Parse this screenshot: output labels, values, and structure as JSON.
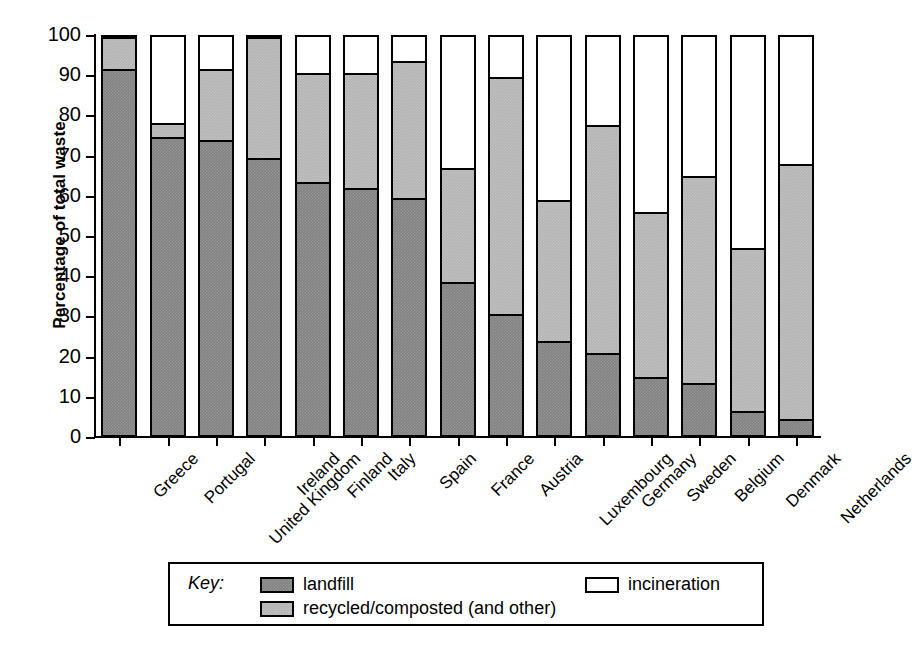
{
  "chart_data": {
    "type": "bar",
    "subtype": "stacked-bar-100",
    "title": "",
    "xlabel": "",
    "ylabel": "Percentage of total waste",
    "ylim": [
      0,
      100
    ],
    "yticks": [
      0,
      10,
      20,
      30,
      40,
      50,
      60,
      70,
      80,
      90,
      100
    ],
    "grid": false,
    "legend_position": "bottom",
    "legend_prefix": "Key:",
    "categories": [
      "Greece",
      "Portugal",
      "United Kingdom",
      "Ireland",
      "Finland",
      "Italy",
      "Spain",
      "France",
      "Austria",
      "Luxembourg",
      "Germany",
      "Sweden",
      "Belgium",
      "Denmark",
      "Netherlands"
    ],
    "series": [
      {
        "name": "landfill",
        "color": "#828282",
        "values": [
          92,
          75,
          74,
          69.5,
          63.5,
          62,
          59.5,
          38.5,
          30.5,
          23.5,
          20.5,
          14.5,
          13,
          6,
          4
        ]
      },
      {
        "name": "recycled/composted (and other)",
        "color": "#b4b4b4",
        "values": [
          8,
          3.5,
          18,
          30.5,
          27.5,
          29,
          34.5,
          28.5,
          59.5,
          35.5,
          57.5,
          41.5,
          52,
          41,
          64
        ]
      },
      {
        "name": "incineration",
        "color": "#ffffff",
        "values": [
          0,
          21.5,
          8,
          0,
          9,
          9,
          6,
          33,
          10,
          41,
          22,
          44,
          35,
          53,
          32
        ]
      }
    ],
    "cumulative_tops": {
      "landfill": [
        92,
        75,
        74,
        69.5,
        63.5,
        62,
        59.5,
        38.5,
        30.5,
        23.5,
        20.5,
        14.5,
        13,
        6,
        4
      ],
      "recycled": [
        100,
        78.5,
        92,
        100,
        91,
        91,
        94,
        67,
        90,
        59,
        78,
        56,
        65,
        47,
        68
      ],
      "total": [
        100,
        100,
        100,
        100,
        100,
        100,
        100,
        100,
        100,
        100,
        100,
        100,
        100,
        100,
        100
      ]
    }
  },
  "legend": {
    "key_word": "Key:",
    "entries": [
      {
        "label": "landfill",
        "swatch": "dark-gray"
      },
      {
        "label": "recycled/composted (and other)",
        "swatch": "light-gray"
      },
      {
        "label": "incineration",
        "swatch": "white"
      }
    ]
  }
}
